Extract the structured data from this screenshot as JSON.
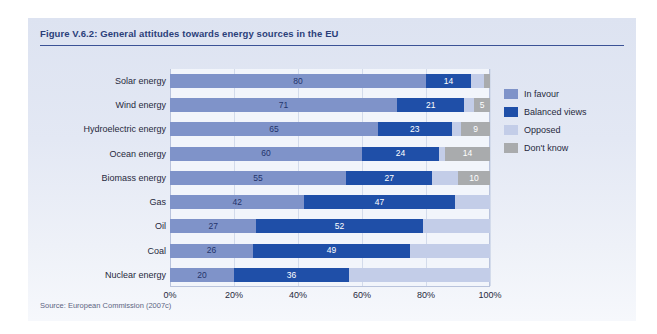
{
  "figure": {
    "title": "Figure V.6.2: General attitudes towards energy sources in the EU",
    "source": "Source: European Commission (2007c)"
  },
  "colors": {
    "in_favour": "#7f93c9",
    "balanced_views": "#1f4fa8",
    "opposed": "#c3cde8",
    "dont_know": "#a9abad",
    "panel_background": "#e3e8f4",
    "plot_background": "#f2f5fb",
    "title_text": "#2b3f7a",
    "title_rule": "#3b5296"
  },
  "legend": {
    "position": "right",
    "items": [
      {
        "label": "In favour",
        "color": "#7f93c9",
        "swatch": "legend-swatch-in-favour"
      },
      {
        "label": "Balanced views",
        "color": "#1f4fa8",
        "swatch": "legend-swatch-balanced-views"
      },
      {
        "label": "Opposed",
        "color": "#c3cde8",
        "swatch": "legend-swatch-opposed"
      },
      {
        "label": "Don't know",
        "color": "#a9abad",
        "swatch": "legend-swatch-dont-know"
      }
    ]
  },
  "chart_data": {
    "type": "bar",
    "orientation": "horizontal",
    "stacked": true,
    "title": "Figure V.6.2: General attitudes towards energy sources in the EU",
    "xlabel": "",
    "ylabel": "",
    "xlim": [
      0,
      100
    ],
    "xticks": [
      "0%",
      "20%",
      "40%",
      "60%",
      "80%",
      "100%"
    ],
    "xtick_values": [
      0,
      20,
      40,
      60,
      80,
      100
    ],
    "grid": true,
    "categories": [
      "Solar energy",
      "Wind energy",
      "Hydroelectric energy",
      "Ocean energy",
      "Biomass energy",
      "Gas",
      "Oil",
      "Coal",
      "Nuclear energy"
    ],
    "series": [
      {
        "name": "In favour",
        "color": "#7f93c9",
        "values": [
          80,
          71,
          65,
          60,
          55,
          42,
          27,
          26,
          20
        ],
        "labels": [
          "80",
          "71",
          "65",
          "60",
          "55",
          "42",
          "27",
          "26",
          "20"
        ]
      },
      {
        "name": "Balanced views",
        "color": "#1f4fa8",
        "values": [
          14,
          21,
          23,
          24,
          27,
          47,
          52,
          49,
          36
        ],
        "labels": [
          "14",
          "21",
          "23",
          "24",
          "27",
          "47",
          "52",
          "49",
          "36"
        ]
      },
      {
        "name": "Opposed",
        "color": "#c3cde8",
        "values": [
          4,
          3,
          3,
          2,
          8,
          11,
          21,
          25,
          44
        ],
        "labels": [
          "",
          "",
          "",
          "",
          "",
          "",
          "",
          "",
          ""
        ]
      },
      {
        "name": "Don't know",
        "color": "#a9abad",
        "values": [
          2,
          5,
          9,
          14,
          10,
          0,
          0,
          0,
          0
        ],
        "labels": [
          "",
          "5",
          "9",
          "14",
          "10",
          "",
          "",
          "",
          ""
        ]
      }
    ]
  }
}
